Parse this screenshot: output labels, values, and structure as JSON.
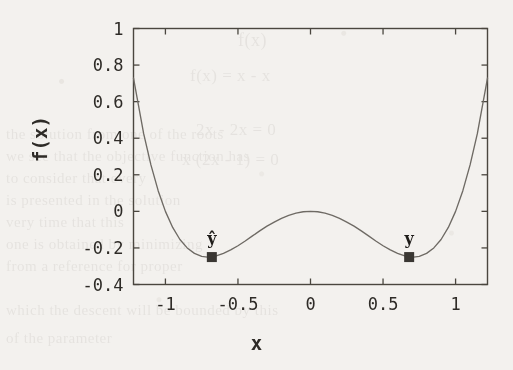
{
  "page": {
    "background_color": "#f3f1ee",
    "ink_color": "#2e2b27",
    "ghost_text": [
      "f(x)",
      "f(x) = x  - x",
      "2x  - 2x = 0",
      "x (2x  - 1) = 0",
      "the solution from one of the roots",
      "we see that the objective function has",
      "to consider that every",
      "is presented in the solution",
      "very time that this",
      "one is obtained by minimizing",
      "from a reference for proper",
      "which the descent will be bounded by this",
      "of the parameter"
    ]
  },
  "chart_data": {
    "type": "line",
    "title": "",
    "xlabel": "x",
    "ylabel": "f(x)",
    "xlim": [
      -1.22,
      1.22
    ],
    "ylim": [
      -0.4,
      1.0
    ],
    "xticks": [
      "-1",
      "-0.5",
      "0",
      "0.5",
      "1"
    ],
    "xtick_values": [
      -1,
      -0.5,
      0,
      0.5,
      1
    ],
    "yticks": [
      "1",
      "0.8",
      "0.6",
      "0.4",
      "0.2",
      "0",
      "-0.2",
      "-0.4"
    ],
    "ytick_values": [
      1,
      0.8,
      0.6,
      0.4,
      0.2,
      0,
      -0.2,
      -0.4
    ],
    "grid": false,
    "legend": "none",
    "line_color": "#6e6a64",
    "marker_color": "#3a3733",
    "series": [
      {
        "name": "f(x)",
        "formula": "x^4 - x^2",
        "x": [
          -1.22,
          -1.15,
          -1.1,
          -1.05,
          -1.0,
          -0.95,
          -0.9,
          -0.85,
          -0.8,
          -0.75,
          -0.71,
          -0.65,
          -0.6,
          -0.55,
          -0.5,
          -0.45,
          -0.4,
          -0.35,
          -0.3,
          -0.25,
          -0.2,
          -0.15,
          -0.1,
          -0.05,
          0.0,
          0.05,
          0.1,
          0.15,
          0.2,
          0.25,
          0.3,
          0.35,
          0.4,
          0.45,
          0.5,
          0.55,
          0.6,
          0.65,
          0.71,
          0.75,
          0.8,
          0.85,
          0.9,
          0.95,
          1.0,
          1.05,
          1.1,
          1.15,
          1.22
        ],
        "y": [
          0.729,
          0.425,
          0.254,
          0.113,
          0.0,
          -0.088,
          -0.154,
          -0.2,
          -0.23,
          -0.246,
          -0.25,
          -0.244,
          -0.23,
          -0.211,
          -0.188,
          -0.162,
          -0.134,
          -0.107,
          -0.081,
          -0.059,
          -0.038,
          -0.022,
          -0.01,
          -0.002,
          0.0,
          -0.002,
          -0.01,
          -0.022,
          -0.038,
          -0.059,
          -0.081,
          -0.107,
          -0.134,
          -0.162,
          -0.188,
          -0.211,
          -0.23,
          -0.244,
          -0.25,
          -0.246,
          -0.23,
          -0.2,
          -0.154,
          -0.088,
          0.0,
          0.113,
          0.254,
          0.425,
          0.729
        ]
      }
    ],
    "annotated_points": [
      {
        "label": "ŷ",
        "x": -0.68,
        "y": -0.25,
        "marker": "filled-square"
      },
      {
        "label": "y",
        "x": 0.68,
        "y": -0.25,
        "marker": "filled-square"
      }
    ]
  }
}
